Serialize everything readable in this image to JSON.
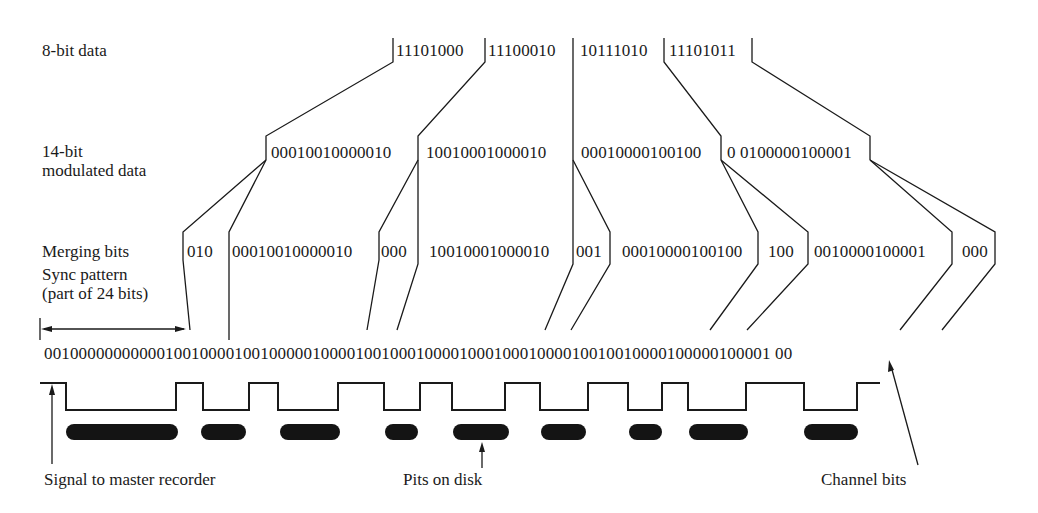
{
  "figure": {
    "row_labels": {
      "eight_bit": "8-bit data",
      "fourteen_bit_line1": "14-bit",
      "fourteen_bit_line2": "modulated data",
      "merging": "Merging bits",
      "sync_line1": "Sync pattern",
      "sync_line2": "(part of 24 bits)"
    },
    "eight_bit_data": [
      "11101000",
      "11100010",
      "10111010",
      "11101011"
    ],
    "fourteen_bit_data": [
      "00010010000010",
      "10010001000010",
      "00010000100100",
      "0 0100000100001"
    ],
    "merging_row": [
      "010",
      "00010010000010",
      "000",
      "10010001000010",
      "001",
      "00010000100100",
      "100",
      "0010000100001",
      "000"
    ],
    "channel_bitstream": "001000000000001001000010010000010000100100010000100010001000010010010000100000100001 00",
    "annotations": {
      "signal": "Signal to master recorder",
      "pits": "Pits on disk",
      "channel_bits": "Channel bits"
    },
    "pits": [
      {
        "x": 66,
        "width": 112
      },
      {
        "x": 201,
        "width": 45
      },
      {
        "x": 280,
        "width": 60
      },
      {
        "x": 385,
        "width": 33
      },
      {
        "x": 453,
        "width": 56
      },
      {
        "x": 541,
        "width": 45
      },
      {
        "x": 629,
        "width": 33
      },
      {
        "x": 689,
        "width": 59
      },
      {
        "x": 804,
        "width": 54
      }
    ]
  }
}
